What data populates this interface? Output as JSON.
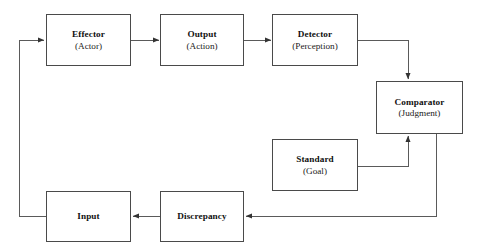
{
  "diagram": {
    "type": "flow-diagram",
    "stroke_color": "#4a4a4a",
    "text_color": "#101010",
    "background_color": "#ffffff",
    "nodes": [
      {
        "id": "effector",
        "title": "Effector",
        "sub": "(Actor)",
        "x": 46,
        "y": 14,
        "w": 85,
        "h": 52
      },
      {
        "id": "output",
        "title": "Output",
        "sub": "(Action)",
        "x": 160,
        "y": 14,
        "w": 84,
        "h": 52
      },
      {
        "id": "detector",
        "title": "Detector",
        "sub": "(Perception)",
        "x": 272,
        "y": 14,
        "w": 86,
        "h": 52
      },
      {
        "id": "comparator",
        "title": "Comparator",
        "sub": "(Judgment)",
        "x": 376,
        "y": 81,
        "w": 87,
        "h": 53
      },
      {
        "id": "standard",
        "title": "Standard",
        "sub": "(Goal)",
        "x": 272,
        "y": 139,
        "w": 86,
        "h": 52
      },
      {
        "id": "discrepancy",
        "title": "Discrepancy",
        "sub": "",
        "x": 160,
        "y": 191,
        "w": 84,
        "h": 51
      },
      {
        "id": "input",
        "title": "Input",
        "sub": "",
        "x": 46,
        "y": 191,
        "w": 85,
        "h": 51
      }
    ],
    "edges": [
      {
        "id": "effector-to-output",
        "from": "effector",
        "to": "output",
        "label": ""
      },
      {
        "id": "output-to-detector",
        "from": "output",
        "to": "detector",
        "label": ""
      },
      {
        "id": "detector-to-comparator",
        "from": "detector",
        "to": "comparator",
        "label": ""
      },
      {
        "id": "standard-to-comparator",
        "from": "standard",
        "to": "comparator",
        "label": ""
      },
      {
        "id": "comparator-to-discrepancy",
        "from": "comparator",
        "to": "discrepancy",
        "label": ""
      },
      {
        "id": "discrepancy-to-input",
        "from": "discrepancy",
        "to": "input",
        "label": ""
      },
      {
        "id": "input-to-effector",
        "from": "input",
        "to": "effector",
        "label": ""
      }
    ]
  }
}
